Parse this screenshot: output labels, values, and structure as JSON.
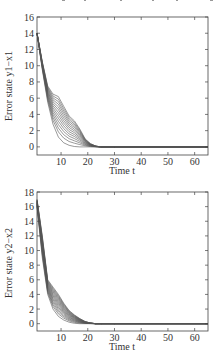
{
  "chart_data": [
    {
      "type": "line",
      "title": "",
      "xlabel": "Time t",
      "ylabel": "Error state y1−x1",
      "xlim": [
        1,
        65
      ],
      "ylim": [
        -1,
        16
      ],
      "xticks": [
        10,
        20,
        30,
        40,
        50,
        60
      ],
      "yticks": [
        0,
        2,
        4,
        6,
        8,
        10,
        12,
        14,
        16
      ],
      "grid": false,
      "legend": "none",
      "description": "Many trajectories start near 14 at t=1 and decay to 0 by about t=22-25, with a fan of curves between t=5 and t=20 (upper curves show a shoulder near 6.5 at t≈8 and ≈3 at t≈15).",
      "series_envelope": {
        "x": [
          1,
          3,
          5,
          7,
          9,
          11,
          13,
          15,
          17,
          19,
          21,
          23,
          25,
          30,
          65
        ],
        "lower": [
          14,
          9.5,
          5.5,
          2.8,
          1.2,
          0.5,
          0.2,
          0.05,
          0,
          0,
          0,
          0,
          0,
          0,
          0
        ],
        "upper": [
          14,
          10.5,
          7.5,
          6.5,
          6.2,
          5.0,
          3.8,
          3.2,
          2.2,
          1.0,
          0.4,
          0.1,
          0,
          0,
          0
        ]
      },
      "num_series": 14
    },
    {
      "type": "line",
      "title": "",
      "xlabel": "Time t",
      "ylabel": "Error state y2−x2",
      "xlim": [
        1,
        65
      ],
      "ylim": [
        -1,
        18
      ],
      "xticks": [
        10,
        20,
        30,
        40,
        50,
        60
      ],
      "yticks": [
        0,
        2,
        4,
        6,
        8,
        10,
        12,
        14,
        16,
        18
      ],
      "grid": false,
      "legend": "none",
      "description": "Dense bundle of trajectories starting between ~16 and ~17 at t=1, decaying rapidly to ~4-5 by t≈6, then to 0 by about t=22-24.",
      "series_envelope": {
        "x": [
          1,
          3,
          5,
          7,
          9,
          11,
          13,
          15,
          17,
          19,
          21,
          23,
          25,
          30,
          65
        ],
        "lower": [
          16,
          9,
          4.0,
          2.0,
          1.0,
          0.5,
          0.2,
          0.05,
          0,
          0,
          0,
          0,
          0,
          0,
          0
        ],
        "upper": [
          17,
          12,
          6.0,
          5.0,
          4.0,
          2.8,
          1.8,
          1.2,
          0.7,
          0.3,
          0.1,
          0,
          0,
          0,
          0
        ]
      },
      "num_series": 16
    }
  ],
  "plots": {
    "top": {
      "ylabel": "Error state y1−x1",
      "xlabel": "Time t",
      "xtick_labels": [
        "10",
        "20",
        "30",
        "40",
        "50",
        "60"
      ],
      "ytick_labels": [
        "0",
        "2",
        "4",
        "6",
        "8",
        "10",
        "12",
        "14",
        "16"
      ]
    },
    "bottom": {
      "ylabel": "Error state y2−x2",
      "xlabel": "Time t",
      "xtick_labels": [
        "10",
        "20",
        "30",
        "40",
        "50",
        "60"
      ],
      "ytick_labels": [
        "0",
        "2",
        "4",
        "6",
        "8",
        "10",
        "12",
        "14",
        "16",
        "18"
      ]
    }
  },
  "colors": {
    "curve": "#555555",
    "frame": "#444444",
    "background": "#ffffff"
  }
}
